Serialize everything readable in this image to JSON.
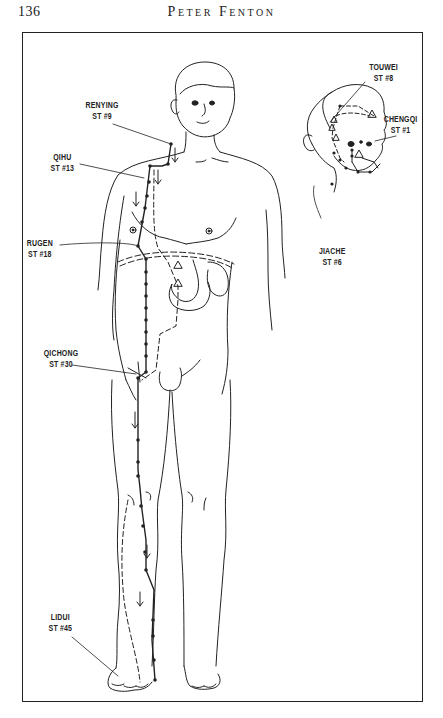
{
  "header": {
    "page_number": "136",
    "running_head": "Peter Fenton"
  },
  "figure": {
    "labels": [
      {
        "id": "renying",
        "name": "RENYING",
        "code": "ST #9"
      },
      {
        "id": "qihu",
        "name": "QIHU",
        "code": "ST #13"
      },
      {
        "id": "rugen",
        "name": "RUGEN",
        "code": "ST #18"
      },
      {
        "id": "qichong",
        "name": "QICHONG",
        "code": "ST #30"
      },
      {
        "id": "lidui",
        "name": "LIDUI",
        "code": "ST #45"
      },
      {
        "id": "touwei",
        "name": "TOUWEI",
        "code": "ST #8"
      },
      {
        "id": "chengqi",
        "name": "CHENGQI",
        "code": "ST #1"
      },
      {
        "id": "jiache",
        "name": "JIACHE",
        "code": "ST #6"
      }
    ]
  }
}
